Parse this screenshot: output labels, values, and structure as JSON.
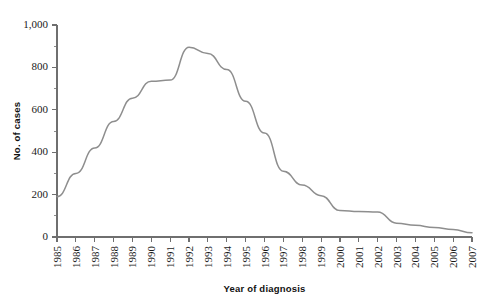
{
  "chart_data": {
    "type": "line",
    "title": "",
    "subtitle": "",
    "xlabel": "Year of diagnosis",
    "ylabel": "No. of cases",
    "x": [
      1985,
      1986,
      1987,
      1988,
      1989,
      1990,
      1991,
      1992,
      1993,
      1994,
      1995,
      1996,
      1997,
      1998,
      1999,
      2000,
      2001,
      2002,
      2003,
      2004,
      2005,
      2006,
      2007
    ],
    "categories": [
      "1985",
      "1986",
      "1987",
      "1988",
      "1989",
      "1990",
      "1991",
      "1992",
      "1993",
      "1994",
      "1995",
      "1996",
      "1997",
      "1998",
      "1999",
      "2000",
      "2001",
      "2002",
      "2003",
      "2004",
      "2005",
      "2006",
      "2007"
    ],
    "values": [
      190,
      300,
      420,
      545,
      655,
      735,
      740,
      895,
      865,
      790,
      640,
      490,
      310,
      245,
      195,
      125,
      120,
      118,
      65,
      55,
      45,
      35,
      20
    ],
    "series": [
      {
        "name": "No. of cases",
        "values": [
          190,
          300,
          420,
          545,
          655,
          735,
          740,
          895,
          865,
          790,
          640,
          490,
          310,
          245,
          195,
          125,
          120,
          118,
          65,
          55,
          45,
          35,
          20
        ]
      }
    ],
    "xlim": [
      1985,
      2007
    ],
    "ylim": [
      0,
      1000
    ],
    "ytick_values": [
      0,
      200,
      400,
      600,
      800,
      1000
    ],
    "ytick_labels": [
      "0",
      "200",
      "400",
      "600",
      "800",
      "1,000"
    ],
    "yminor_values": [
      100,
      300,
      500,
      700,
      900
    ],
    "grid": false,
    "legend": false,
    "legend_position": "none",
    "line_color": "#8e8e8e",
    "axis_color": "#6f6f6f",
    "text_color": "#1a1a1a",
    "annotations": []
  }
}
